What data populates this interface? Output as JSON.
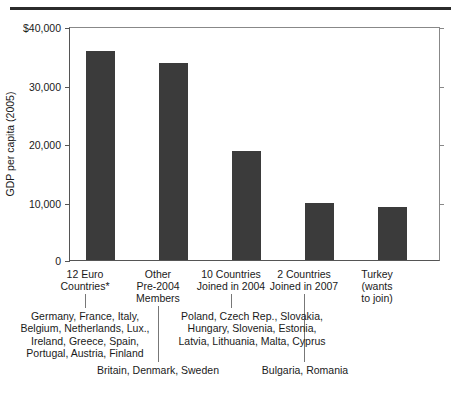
{
  "chart_data": {
    "type": "bar",
    "title": "",
    "xlabel": "",
    "ylabel": "GDP per capita (2005)",
    "ylim": [
      0,
      40000
    ],
    "grid": false,
    "legend": "none",
    "ytick_labels": [
      "$40,000",
      "30,000",
      "20,000",
      "10,000",
      "0"
    ],
    "ytick_values": [
      40000,
      30000,
      20000,
      10000,
      0
    ],
    "categories": [
      "12 Euro Countries*",
      "Other Pre-2004 Members",
      "10 Countries Joined in 2004",
      "2 Countries Joined in 2007",
      "Turkey (wants to join)"
    ],
    "values": [
      35800,
      33700,
      18600,
      9700,
      9100
    ],
    "bar_color": "#3b3b3b",
    "annotations": [
      "Germany, France, Italy, Belgium, Netherlands, Lux., Ireland, Greece, Spain, Portugal, Austria, Finland",
      "Britain, Denmark, Sweden",
      "Poland, Czech Rep., Slovakia, Hungary, Slovenia, Estonia, Latvia, Lithuania, Malta, Cyprus",
      "Bulgaria, Romania"
    ]
  },
  "axis": {
    "y_title": "GDP per capita (2005)",
    "ticks": [
      {
        "label": "$40,000"
      },
      {
        "label": "30,000"
      },
      {
        "label": "20,000"
      },
      {
        "label": "10,000"
      },
      {
        "label": "0"
      }
    ]
  },
  "bars": [
    {
      "label_line1": "12 Euro",
      "label_line2": "Countries*",
      "label_line3": ""
    },
    {
      "label_line1": "Other",
      "label_line2": "Pre-2004",
      "label_line3": "Members"
    },
    {
      "label_line1": "10 Countries",
      "label_line2": "Joined in 2004",
      "label_line3": ""
    },
    {
      "label_line1": "2 Countries",
      "label_line2": "Joined in 2007",
      "label_line3": ""
    },
    {
      "label_line1": "Turkey",
      "label_line2": "(wants",
      "label_line3": "to join)"
    }
  ],
  "annotations": {
    "euro12": {
      "line1": "Germany, France, Italy,",
      "line2": "Belgium, Netherlands, Lux.,",
      "line3": "Ireland, Greece, Spain,",
      "line4": "Portugal, Austria, Finland"
    },
    "pre2004": {
      "line1": "Britain, Denmark, Sweden"
    },
    "joined2004": {
      "line1": "Poland, Czech Rep., Slovakia,",
      "line2": "Hungary, Slovenia, Estonia,",
      "line3": "Latvia, Lithuania, Malta, Cyprus"
    },
    "joined2007": {
      "line1": "Bulgaria, Romania"
    }
  }
}
